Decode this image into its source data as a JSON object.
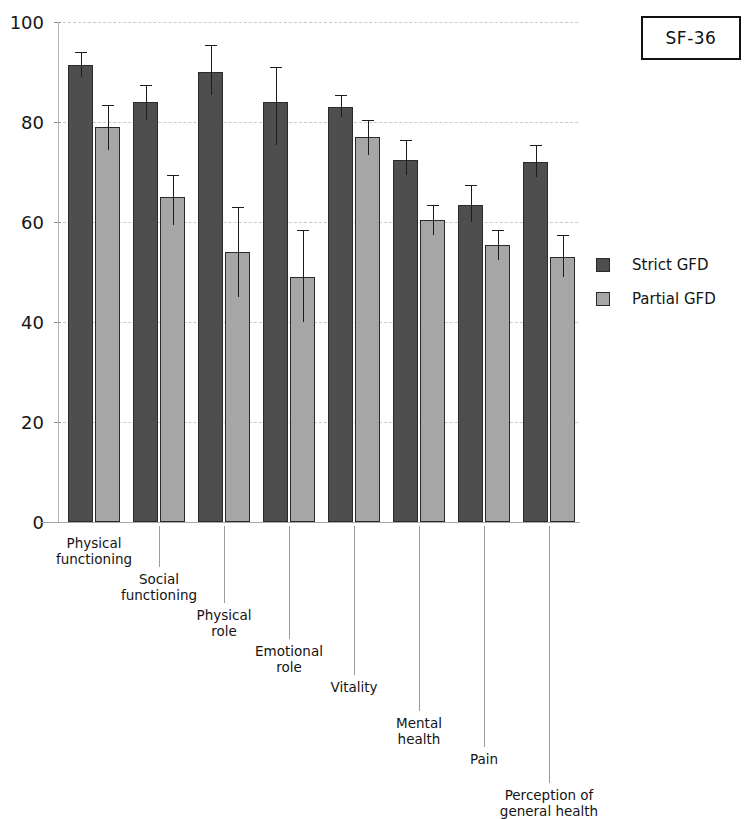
{
  "title_box": {
    "label": "SF-36"
  },
  "legend": {
    "position": "right",
    "entries": [
      {
        "label": "Strict GFD",
        "color": "#4e4e4e",
        "swatch": "strict"
      },
      {
        "label": "Partial GFD",
        "color": "#a6a6a6",
        "swatch": "partial"
      }
    ]
  },
  "chart_data": {
    "type": "bar",
    "title": "SF-36",
    "xlabel": "",
    "ylabel": "",
    "ylim": [
      0,
      100
    ],
    "yticks": [
      0,
      20,
      40,
      60,
      80,
      100
    ],
    "ytick_labels": [
      "0",
      "20",
      "40",
      "60",
      "80",
      "100"
    ],
    "grid": true,
    "error_bars": "95% CI / SD whiskers",
    "categories": [
      "Physical functioning",
      "Social functioning",
      "Physical role",
      "Emotional role",
      "Vitality",
      "Mental health",
      "Pain",
      "Perception of general health"
    ],
    "category_lines": [
      [
        "Physical",
        "functioning"
      ],
      [
        "Social",
        "functioning"
      ],
      [
        "Physical",
        "role"
      ],
      [
        "Emotional",
        "role"
      ],
      [
        "Vitality"
      ],
      [
        "Mental",
        "health"
      ],
      [
        "Pain"
      ],
      [
        "Perception of",
        "general health"
      ]
    ],
    "series": [
      {
        "name": "Strict GFD",
        "color": "#4e4e4e",
        "values": [
          91.5,
          84.0,
          90.0,
          84.0,
          83.0,
          72.5,
          63.5,
          72.0
        ],
        "err_low": [
          89.0,
          80.5,
          85.5,
          75.5,
          81.0,
          69.5,
          60.0,
          69.0
        ],
        "err_high": [
          94.0,
          87.5,
          95.5,
          91.0,
          85.5,
          76.5,
          67.5,
          75.5
        ]
      },
      {
        "name": "Partial GFD",
        "color": "#a6a6a6",
        "values": [
          79.0,
          65.0,
          54.0,
          49.0,
          77.0,
          60.5,
          55.5,
          53.0
        ],
        "err_low": [
          74.5,
          59.5,
          45.0,
          40.0,
          73.5,
          57.5,
          52.5,
          49.0
        ],
        "err_high": [
          83.5,
          69.5,
          63.0,
          58.5,
          80.5,
          63.5,
          58.5,
          57.5
        ]
      }
    ]
  }
}
